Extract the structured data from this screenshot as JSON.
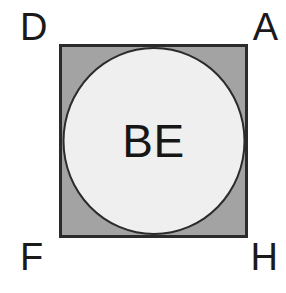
{
  "figure": {
    "background_color": "#ffffff",
    "square": {
      "fill_color": "#a3a3a3",
      "stroke_color": "#2b2b2b",
      "stroke_width_px": 3
    },
    "circle": {
      "label": "BE",
      "fill_color": "#efefef",
      "stroke_color": "#2b2b2b",
      "stroke_width_px": 2
    },
    "corner_labels": {
      "top_left": "D",
      "top_right": "A",
      "bottom_left": "F",
      "bottom_right": "H"
    },
    "text_color": "#1a1a1a"
  }
}
